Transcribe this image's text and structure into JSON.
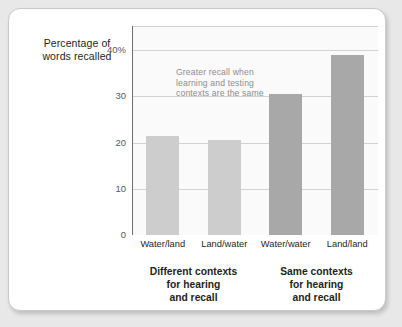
{
  "chart_data": {
    "type": "bar",
    "title": "",
    "subtitle": "",
    "xlabel": "",
    "ylabel": "Percentage of words recalled",
    "ylabel_lines": [
      "Percentage of",
      "words recalled"
    ],
    "categories": [
      "Water/land",
      "Land/water",
      "Water/water",
      "Land/land"
    ],
    "values": [
      21.5,
      20.5,
      30.5,
      39
    ],
    "ylim": [
      0,
      45
    ],
    "yticks": [
      0,
      10,
      20,
      30,
      40
    ],
    "ytick_labels": [
      "0",
      "10",
      "20",
      "30",
      "40%"
    ],
    "grid": "horizontal",
    "legend": "none",
    "series": [
      {
        "name": "Percentage of words recalled",
        "values": [
          21.5,
          20.5,
          30.5,
          39
        ],
        "bar_colors": [
          "#cdcdcd",
          "#cdcdcd",
          "#a8a8a8",
          "#a8a8a8"
        ]
      }
    ],
    "annotations": [
      {
        "name": "greater-recall-note",
        "lines": [
          "Greater recall when",
          "learning and testing",
          "contexts are the same"
        ],
        "color": "#8d8d8d"
      }
    ],
    "groups": [
      {
        "name": "different-contexts",
        "lines": [
          "Different contexts",
          "for hearing",
          "and recall"
        ],
        "categories": [
          "Water/land",
          "Land/water"
        ]
      },
      {
        "name": "same-contexts",
        "lines": [
          "Same contexts",
          "for hearing",
          "and recall"
        ],
        "categories": [
          "Water/water",
          "Land/land"
        ]
      }
    ],
    "colors": {
      "bar_light": "#cdcdcd",
      "bar_dark": "#a8a8a8",
      "gridline": "#d2d2d2",
      "axis": "#6f6f6f",
      "plot_background": "#fafafa",
      "card_background": "#ffffff",
      "page_background": "#e8e8e8",
      "text": "#231f20",
      "tick_text": "#58585a",
      "annotation_text": "#8d8d8d"
    }
  }
}
